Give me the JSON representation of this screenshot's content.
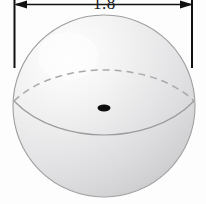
{
  "figure": {
    "background_color": "#fdfdfd"
  },
  "dimension": {
    "label": "1.8",
    "measures": "diameter",
    "orientation": "horizontal",
    "arrow_style": "double-headed",
    "label_color": "#1a1a1a",
    "line_color": "#111111",
    "left_extension_name": "left-extension-line",
    "right_extension_name": "right-extension-line"
  },
  "sphere": {
    "center_x": 104,
    "center_y": 106,
    "radius": 91,
    "outline_color": "#9a9a9a",
    "fill_light": "#fefefe",
    "fill_mid": "#ececed",
    "fill_dark": "#d4d4d6",
    "highlight_position": "upper-left",
    "shadow_position": "lower-right"
  },
  "equator": {
    "back_arc_style": "dashed",
    "front_arc_style": "solid",
    "arc_color": "#9b9b9e",
    "back_arc_color": "#a9a9ac"
  },
  "center_point": {
    "shape": "ellipse",
    "color": "#0d0d0d",
    "cx": 104,
    "cy": 108,
    "rx": 6.5,
    "ry": 3.4
  }
}
